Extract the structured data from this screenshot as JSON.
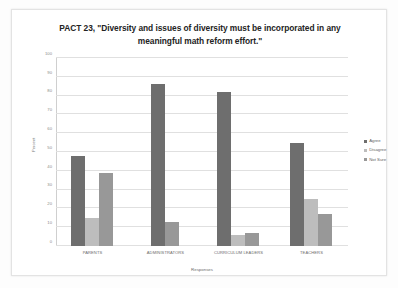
{
  "chart_data": {
    "type": "bar",
    "title": "PACT 23, \"Diversity and issues of diversity must be incorporated in any meaningful math reform effort.\"",
    "xlabel": "Responses",
    "ylabel": "Percent",
    "ylim": [
      0,
      100
    ],
    "ytick_step": 10,
    "yticks": [
      "0",
      "10",
      "20",
      "30",
      "40",
      "50",
      "60",
      "70",
      "80",
      "90",
      "100"
    ],
    "grid": true,
    "legend_position": "right",
    "categories": [
      "PARENTS",
      "ADMINISTRATORS",
      "CURRICULUM LEADERS",
      "TEACHERS"
    ],
    "series": [
      {
        "name": "Agree",
        "color": "#6e6e6e",
        "values": [
          48,
          86,
          82,
          55
        ]
      },
      {
        "name": "Disagree",
        "color": "#bdbdbd",
        "values": [
          15,
          0,
          6,
          25
        ]
      },
      {
        "name": "Not Sure",
        "color": "#989898",
        "values": [
          39,
          13,
          7,
          17
        ]
      }
    ]
  },
  "legend": {
    "items": [
      {
        "label": "Agree"
      },
      {
        "label": "Disagree"
      },
      {
        "label": "Not Sure"
      }
    ]
  }
}
